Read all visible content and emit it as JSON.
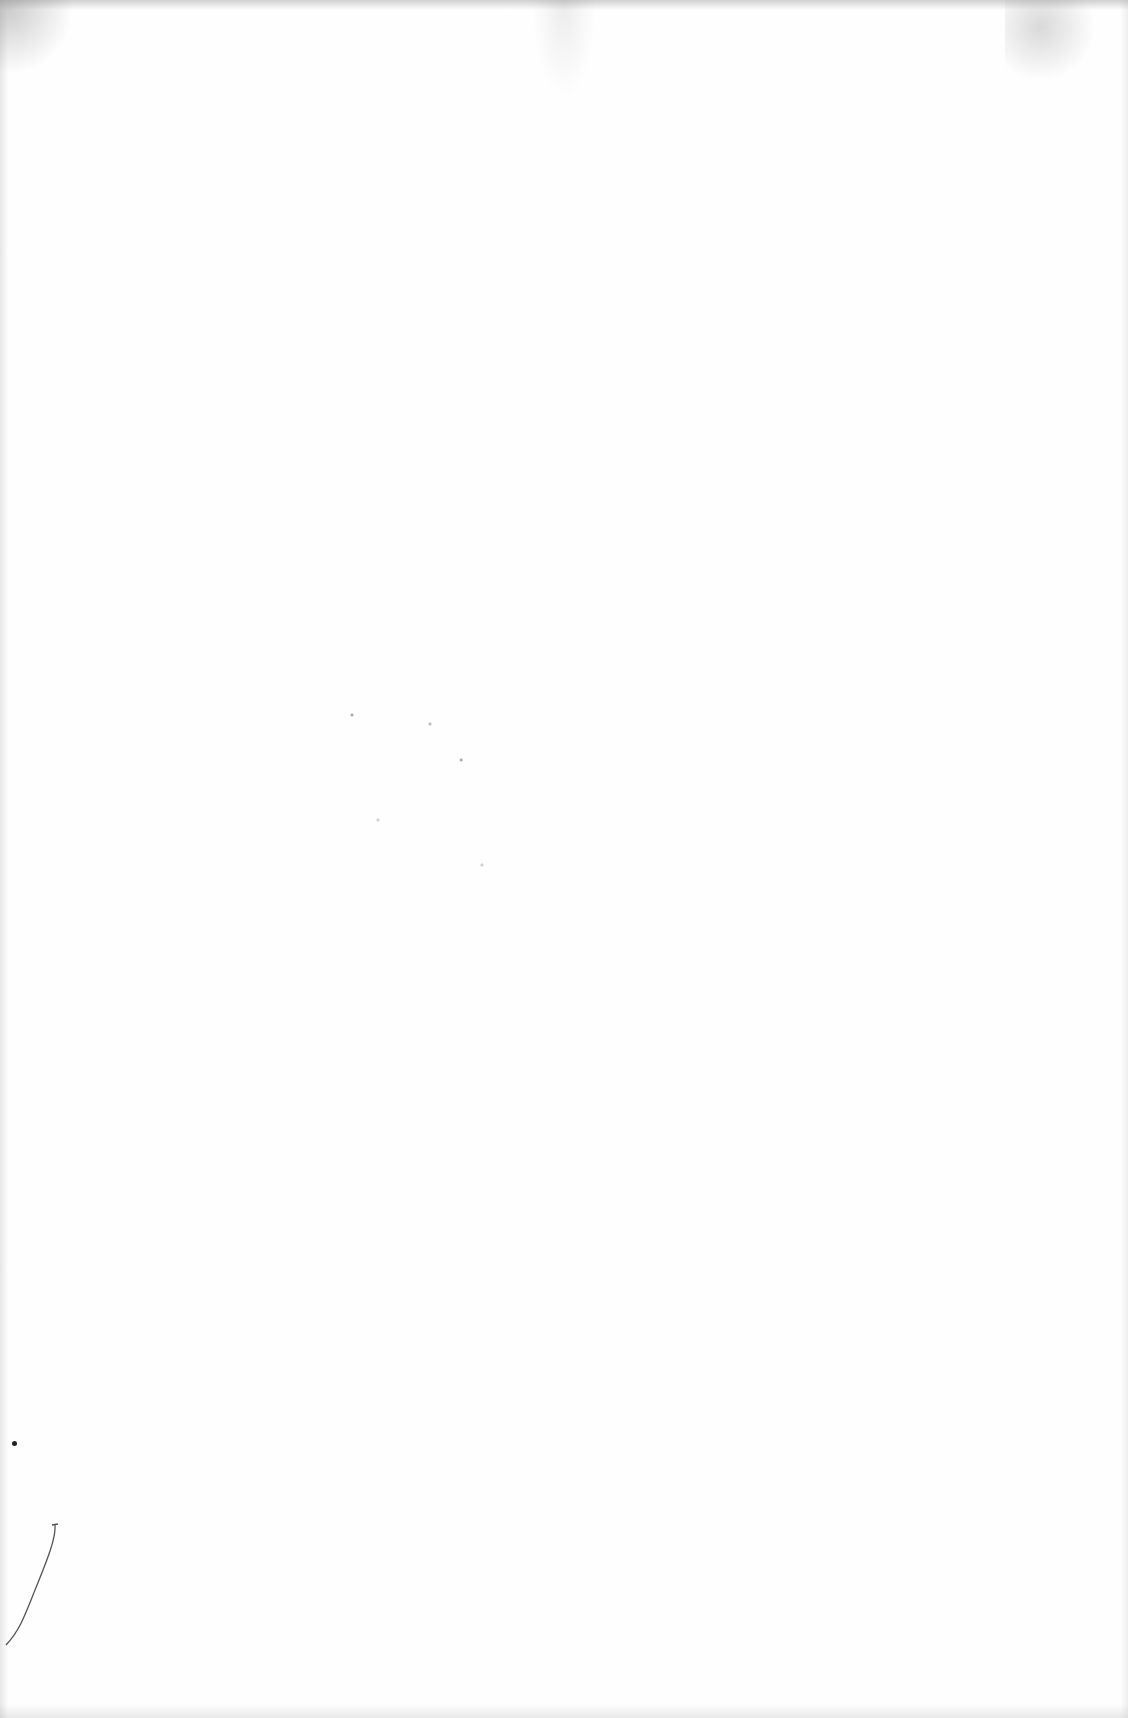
{
  "document": {
    "type": "blank scanned page",
    "text_blocks": [],
    "artifacts": [
      {
        "kind": "scan-edge-shadow",
        "location": "top"
      },
      {
        "kind": "speck-noise",
        "location": "top-left"
      },
      {
        "kind": "speck-noise",
        "location": "top-right"
      },
      {
        "kind": "speck-cluster",
        "location": "center-left"
      },
      {
        "kind": "dot",
        "location": "bottom-left"
      },
      {
        "kind": "hair-fiber",
        "location": "bottom-left"
      }
    ]
  }
}
